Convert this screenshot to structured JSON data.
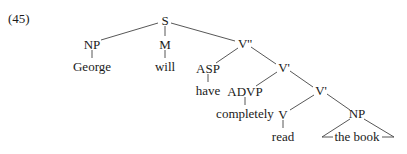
{
  "example_number": "(45)",
  "tree": {
    "nodes": {
      "S": "S",
      "NP_subj": "NP",
      "George": "George",
      "M": "M",
      "will": "will",
      "V2": "V''",
      "ASP": "ASP",
      "have": "have",
      "V1a": "V'",
      "ADVP": "ADVP",
      "completely": "completely",
      "V1b": "V'",
      "V": "V",
      "read": "read",
      "NP_obj": "NP",
      "the_book": "the book"
    },
    "structure": "[S [NP George] [M will] [V'' [ASP have] [V' [ADVP completely] [V' [V read] [NP the book]]]]]"
  }
}
